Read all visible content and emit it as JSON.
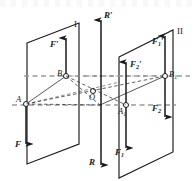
{
  "figure": {
    "name": "two-parallel-planes-force-couple-diagram",
    "background_color": "#ffffff",
    "stroke_color": "#1a1a1a",
    "dashed_color": "#8c8c8c",
    "width": 194,
    "height": 181
  },
  "planes": [
    {
      "id": "plane-1",
      "label": "I"
    },
    {
      "id": "plane-2",
      "label": "II"
    }
  ],
  "points": [
    {
      "id": "point-a",
      "label": "A"
    },
    {
      "id": "point-b",
      "label": "B"
    },
    {
      "id": "point-o",
      "label": "O"
    },
    {
      "id": "point-a1",
      "label": "A",
      "sub": "1"
    },
    {
      "id": "point-b1",
      "label": "B",
      "sub": "1"
    }
  ],
  "vectors": [
    {
      "id": "vector-f-prime",
      "label": "F",
      "prime": "′",
      "sub": "",
      "direction": "up",
      "plane": "I"
    },
    {
      "id": "vector-f",
      "label": "F",
      "prime": "",
      "sub": "",
      "direction": "down",
      "plane": "I"
    },
    {
      "id": "vector-f1-prime",
      "label": "F",
      "prime": "′",
      "sub": "1",
      "direction": "up",
      "plane": "II"
    },
    {
      "id": "vector-f2-prime",
      "label": "F",
      "prime": "′",
      "sub": "2",
      "direction": "up",
      "plane": "II"
    },
    {
      "id": "vector-f1",
      "label": "F",
      "prime": "",
      "sub": "1",
      "direction": "down",
      "plane": "II"
    },
    {
      "id": "vector-f2",
      "label": "F",
      "prime": "",
      "sub": "2",
      "direction": "down",
      "plane": "II"
    },
    {
      "id": "vector-r-prime",
      "label": "R",
      "prime": "′",
      "sub": "",
      "direction": "up",
      "plane": "center"
    },
    {
      "id": "vector-r",
      "label": "R",
      "prime": "",
      "sub": "",
      "direction": "down",
      "plane": "center"
    }
  ],
  "labels": {
    "plane_1": "I",
    "plane_2": "II",
    "point_a": "A",
    "point_b": "B",
    "point_o": "O",
    "point_a1_base": "A",
    "point_a1_sub": "1",
    "point_b1_base": "B",
    "point_b1_sub": "1",
    "f_prime_base": "F",
    "f_prime_mark": "′",
    "f_base": "F",
    "f1_prime_base": "F",
    "f1_prime_sub": "1",
    "f1_prime_mark": "′",
    "f2_prime_base": "F",
    "f2_prime_sub": "2",
    "f2_prime_mark": "′",
    "f1_base": "F",
    "f1_sub": "1",
    "f2_base": "F",
    "f2_sub": "2",
    "r_prime_base": "R",
    "r_prime_mark": "′",
    "r_base": "R"
  }
}
